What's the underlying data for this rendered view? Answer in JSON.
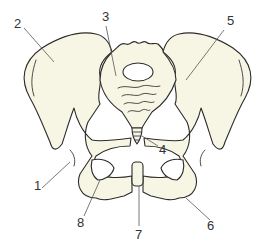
{
  "diagram": {
    "colors": {
      "bone_fill": "#f7f6e4",
      "outline": "#2b2b2b",
      "leader": "#555555",
      "label_text": "#333333",
      "background": "#ffffff"
    },
    "labels": [
      {
        "id": "1",
        "text": "1",
        "x": 34,
        "y": 179
      },
      {
        "id": "2",
        "text": "2",
        "x": 14,
        "y": 17
      },
      {
        "id": "3",
        "text": "3",
        "x": 102,
        "y": 10
      },
      {
        "id": "4",
        "text": "4",
        "x": 159,
        "y": 143
      },
      {
        "id": "5",
        "text": "5",
        "x": 227,
        "y": 14
      },
      {
        "id": "6",
        "text": "6",
        "x": 207,
        "y": 219
      },
      {
        "id": "7",
        "text": "7",
        "x": 135,
        "y": 228
      },
      {
        "id": "8",
        "text": "8",
        "x": 77,
        "y": 216
      }
    ]
  }
}
